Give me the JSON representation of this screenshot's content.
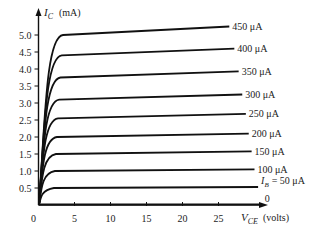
{
  "chart_data": {
    "type": "line",
    "title": "",
    "ylabel": "I_C (mA)",
    "xlabel": "V_CE (volts)",
    "ylabel_main": "I",
    "ylabel_sub": "C",
    "ylabel_unit": "(mA)",
    "xlabel_main": "V",
    "xlabel_sub": "CE",
    "xlabel_unit": "(volts)",
    "xlim": [
      0,
      28
    ],
    "ylim": [
      0,
      5.3
    ],
    "x_ticks": [
      0,
      5,
      10,
      15,
      20,
      25
    ],
    "x_tick_labels": [
      "0",
      "5",
      "10",
      "15",
      "20",
      "25"
    ],
    "y_ticks": [
      0.5,
      1.0,
      1.5,
      2.0,
      2.5,
      3.0,
      3.5,
      4.0,
      4.5,
      5.0
    ],
    "y_tick_labels": [
      "0.5",
      "1.0",
      "1.5",
      "2.0",
      "2.5",
      "3.0",
      "3.5",
      "4.0",
      "4.5",
      "5.0"
    ],
    "origin_label": "0",
    "grid": false,
    "series": [
      {
        "name": "450 μA",
        "label": "450 μA",
        "ic_sat": 5.0,
        "ic_end": 5.25,
        "v_end": 26.5
      },
      {
        "name": "400 μA",
        "label": "400 μA",
        "ic_sat": 4.4,
        "ic_end": 4.6,
        "v_end": 27.2
      },
      {
        "name": "350 μA",
        "label": "350 μA",
        "ic_sat": 3.75,
        "ic_end": 3.93,
        "v_end": 27.8
      },
      {
        "name": "300 μA",
        "label": "300 μA",
        "ic_sat": 3.1,
        "ic_end": 3.25,
        "v_end": 28.3
      },
      {
        "name": "250 μA",
        "label": "250 μA",
        "ic_sat": 2.55,
        "ic_end": 2.68,
        "v_end": 28.8
      },
      {
        "name": "200 μA",
        "label": "200 μA",
        "ic_sat": 2.0,
        "ic_end": 2.1,
        "v_end": 29.2
      },
      {
        "name": "150 μA",
        "label": "150 μA",
        "ic_sat": 1.5,
        "ic_end": 1.58,
        "v_end": 29.6
      },
      {
        "name": "100 μA",
        "label": "100 μA",
        "ic_sat": 1.0,
        "ic_end": 1.05,
        "v_end": 30.0
      },
      {
        "name": "I_B = 50 μA",
        "label": "= 50 μA",
        "label_prefix": "I",
        "label_sub": "B",
        "ic_sat": 0.5,
        "ic_end": 0.53,
        "v_end": 30.5
      },
      {
        "name": "0",
        "label": "0",
        "ic_sat": 0.0,
        "ic_end": 0.02,
        "v_end": 31.0
      }
    ]
  }
}
